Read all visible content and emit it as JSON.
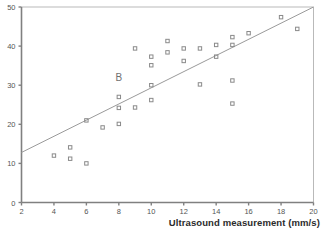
{
  "figure": {
    "panel_label": "B",
    "panel_label_x": 8.0,
    "panel_label_y": 31.0
  },
  "chart_data": {
    "type": "scatter",
    "title": "",
    "subtitle": "",
    "xlabel": "Ultrasound measurement (mm/s)",
    "ylabel": "",
    "xlim": [
      2,
      20
    ],
    "ylim": [
      0,
      50
    ],
    "xticks": [
      2,
      4,
      6,
      8,
      10,
      12,
      14,
      16,
      18,
      20
    ],
    "xticklabels": [
      "2",
      "4",
      "6",
      "8",
      "10",
      "12",
      "14",
      "16",
      "18",
      "20"
    ],
    "yticks": [
      0,
      10,
      20,
      30,
      40,
      50
    ],
    "yticklabels": [
      "0",
      "10",
      "20",
      "30",
      "40",
      "50"
    ],
    "grid": false,
    "legend": null,
    "marker": "open-square",
    "marker_color": "#8a8a8a",
    "axis_color": "#808080",
    "line_color": "#9a9a9a",
    "series": [
      {
        "name": "observations",
        "points": [
          [
            4.0,
            12.0
          ],
          [
            5.0,
            14.1
          ],
          [
            5.0,
            11.2
          ],
          [
            6.0,
            10.0
          ],
          [
            6.0,
            21.0
          ],
          [
            7.0,
            19.2
          ],
          [
            8.0,
            27.0
          ],
          [
            8.0,
            24.2
          ],
          [
            8.0,
            20.1
          ],
          [
            9.0,
            39.4
          ],
          [
            9.0,
            24.3
          ],
          [
            10.0,
            37.3
          ],
          [
            10.0,
            35.1
          ],
          [
            10.0,
            30.0
          ],
          [
            10.0,
            26.2
          ],
          [
            11.0,
            41.3
          ],
          [
            11.0,
            38.4
          ],
          [
            12.0,
            39.4
          ],
          [
            12.0,
            36.2
          ],
          [
            13.0,
            39.4
          ],
          [
            13.0,
            30.2
          ],
          [
            14.0,
            40.3
          ],
          [
            14.0,
            37.3
          ],
          [
            15.0,
            42.3
          ],
          [
            15.0,
            40.3
          ],
          [
            15.0,
            31.2
          ],
          [
            15.0,
            25.3
          ],
          [
            16.0,
            43.3
          ],
          [
            18.0,
            47.4
          ],
          [
            19.0,
            44.4
          ]
        ]
      }
    ],
    "fit_line": {
      "name": "regression-line",
      "x_start": 2,
      "y_start": 12.8,
      "x_end": 20,
      "y_end": 50.0
    }
  }
}
